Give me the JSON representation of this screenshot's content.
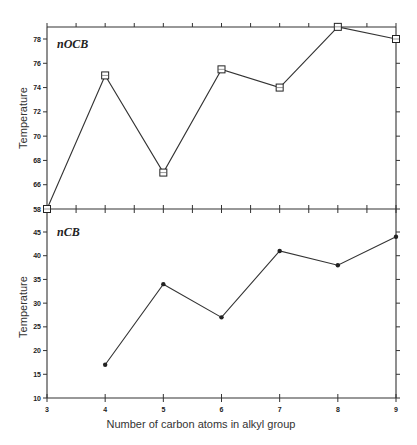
{
  "page": {
    "header_text": "",
    "xlabel": "Number of carbon atoms in alkyl group"
  },
  "chart_data": [
    {
      "type": "line",
      "title": "nOCB",
      "panel_label": "nOCB",
      "xlabel": "Number of carbon atoms in alkyl group",
      "ylabel": "Temperature",
      "x": [
        3,
        4,
        5,
        6,
        7,
        8,
        9
      ],
      "values": [
        64,
        75,
        67,
        75.5,
        74,
        79,
        78
      ],
      "marker": "square-open",
      "xlim": [
        3,
        9
      ],
      "ylim": [
        64,
        79
      ],
      "yticks": [
        64,
        66,
        68,
        70,
        72,
        74,
        76,
        78
      ],
      "xticks": [
        3,
        4,
        5,
        6,
        7,
        8,
        9
      ],
      "grid": false,
      "legend": null
    },
    {
      "type": "line",
      "title": "nCB",
      "panel_label": "nCB",
      "xlabel": "Number of carbon atoms in alkyl group",
      "ylabel": "Temperature",
      "x": [
        4,
        5,
        6,
        7,
        8,
        9
      ],
      "values": [
        17,
        34,
        27,
        41,
        38,
        44
      ],
      "marker": "filled-circle",
      "xlim": [
        3,
        9
      ],
      "ylim": [
        10,
        50
      ],
      "yticks": [
        10,
        15,
        20,
        25,
        30,
        35,
        40,
        45
      ],
      "xticks": [
        3,
        4,
        5,
        6,
        7,
        8,
        9
      ],
      "xtick_labels": [
        "3",
        "4",
        "5",
        "6",
        "7",
        "8",
        "9"
      ],
      "grid": false,
      "legend": null
    }
  ],
  "labels": {
    "top_ylabel": "Temperature",
    "bottom_ylabel": "Temperature",
    "top_panel": "nOCB",
    "bottom_panel": "nCB",
    "overlap_ytick": "64/50"
  }
}
